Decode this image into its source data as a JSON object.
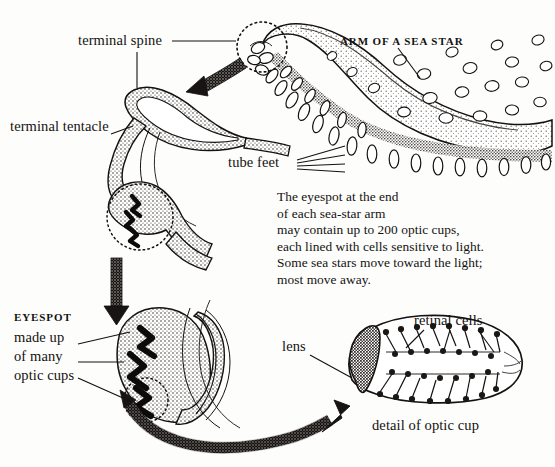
{
  "figure": {
    "background_color": "#fdfdfc",
    "ink_color": "#141210"
  },
  "labels": {
    "terminal_spine": "terminal spine",
    "terminal_tentacle": "terminal tentacle",
    "arm_of_a_sea_star": "ARM OF A SEA STAR",
    "tube_feet": "tube feet",
    "eyespot_caps": "EYESPOT",
    "eyespot_line1": "made up",
    "eyespot_line2": "of many",
    "eyespot_line3": "optic cups",
    "lens": "lens",
    "retinal_cells": "retinal cells",
    "detail_of_optic_cup": "detail of optic cup"
  },
  "caption": {
    "text": "The eyespot at the end\nof each sea-star arm\nmay contain up to 200 optic cups,\neach lined with cells sensitive to light.\nSome sea stars move toward the light;\nmost move away."
  },
  "structures": {
    "optic_cup_count_text": "200",
    "eyespot_optic_cup_marks": 3,
    "detail_retinal_leader_lines": 3,
    "tube_feet_leader_lines": 4
  }
}
